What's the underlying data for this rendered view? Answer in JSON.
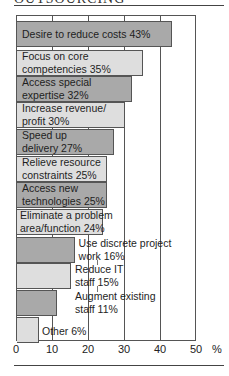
{
  "header": {
    "title": "OUTSOURCING"
  },
  "chart_data": {
    "type": "bar",
    "orientation": "horizontal",
    "title": "",
    "categories": [
      "Desire to reduce costs",
      "Focus on core competencies",
      "Access special expertise",
      "Increase revenue/ profit",
      "Speed up delivery",
      "Relieve resource constraints",
      "Access new technologies",
      "Eliminate a problem area/function",
      "Use discrete project work",
      "Reduce IT staff",
      "Augment existing staff",
      "Other"
    ],
    "values": [
      43,
      35,
      32,
      30,
      27,
      25,
      25,
      24,
      16,
      15,
      11,
      6
    ],
    "labels": [
      [
        "Desire to reduce costs 43%"
      ],
      [
        "Focus on core",
        "competencies 35%"
      ],
      [
        "Access special",
        "expertise 32%"
      ],
      [
        "Increase revenue/",
        "profit 30%"
      ],
      [
        "Speed up",
        "delivery 27%"
      ],
      [
        "Relieve resource",
        "constraints 25%"
      ],
      [
        "Access new",
        "technologies 25%"
      ],
      [
        "Eliminate a problem",
        "area/function 24%"
      ],
      [
        "Use discrete project",
        "work 16%"
      ],
      [
        "Reduce IT",
        "staff 15%"
      ],
      [
        "Augment existing",
        "staff 11%"
      ],
      [
        "Other 6%"
      ]
    ],
    "xlabel": "%",
    "ylabel": "",
    "xlim": [
      0,
      50
    ],
    "xticks": [
      "0",
      "10",
      "20",
      "30",
      "40",
      "50"
    ],
    "grid": true,
    "legend": null,
    "colors": {
      "dark": "#a9a9a9",
      "light": "#dedede"
    }
  },
  "axis": {
    "unit": "%"
  }
}
